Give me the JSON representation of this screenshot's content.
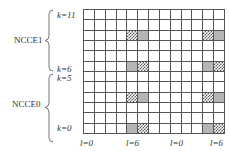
{
  "groups": [
    {
      "label": "NCCE1",
      "k_top": "k=11",
      "k_bottom": "k=6"
    },
    {
      "label": "NCCE0",
      "k_top": "k=5",
      "k_bottom": "k=0"
    }
  ],
  "axis_labels": [
    "l=0",
    "l=6",
    "l=0",
    "l=6"
  ],
  "grid": {
    "rows": 12,
    "cols": 13,
    "row_order": "k=11 (top) to k=0 (bottom)",
    "marked_cells": [
      {
        "k": 9,
        "col": 4,
        "type": "checkered"
      },
      {
        "k": 9,
        "col": 5,
        "type": "gray"
      },
      {
        "k": 9,
        "col": 11,
        "type": "checkered"
      },
      {
        "k": 9,
        "col": 12,
        "type": "gray"
      },
      {
        "k": 6,
        "col": 4,
        "type": "gray"
      },
      {
        "k": 6,
        "col": 5,
        "type": "checkered"
      },
      {
        "k": 6,
        "col": 11,
        "type": "gray"
      },
      {
        "k": 6,
        "col": 12,
        "type": "checkered"
      },
      {
        "k": 3,
        "col": 4,
        "type": "checkered"
      },
      {
        "k": 3,
        "col": 5,
        "type": "gray"
      },
      {
        "k": 3,
        "col": 11,
        "type": "checkered"
      },
      {
        "k": 3,
        "col": 12,
        "type": "gray"
      },
      {
        "k": 0,
        "col": 4,
        "type": "gray"
      },
      {
        "k": 0,
        "col": 5,
        "type": "checkered"
      },
      {
        "k": 0,
        "col": 11,
        "type": "gray"
      },
      {
        "k": 0,
        "col": 12,
        "type": "checkered"
      }
    ]
  },
  "colors": {
    "gray": "#b5b5b5",
    "line": "#555555",
    "background": "#ffffff"
  }
}
